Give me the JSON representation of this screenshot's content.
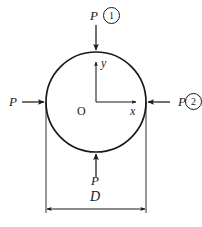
{
  "figure": {
    "shape": "circle",
    "stroke_color": "#1a1a1a",
    "background_color": "#ffffff",
    "geometry": {
      "center_x": 96,
      "center_y": 102,
      "radius": 50,
      "diameter": 100,
      "dimension_line_y": 209,
      "extension_left_x": 46,
      "extension_right_x": 146
    },
    "origin_label": "O",
    "axes": [
      {
        "name": "y-axis",
        "label": "y",
        "direction": "up"
      },
      {
        "name": "x-axis",
        "label": "x",
        "direction": "right"
      }
    ],
    "loads": [
      {
        "name": "load-top",
        "label": "P",
        "marker": "1",
        "direction": "down",
        "has_marker": true
      },
      {
        "name": "load-right",
        "label": "P",
        "marker": "2",
        "direction": "left",
        "has_marker": true
      },
      {
        "name": "load-left",
        "label": "P",
        "marker": "",
        "direction": "right",
        "has_marker": false
      },
      {
        "name": "load-bottom",
        "label": "P",
        "marker": "",
        "direction": "up",
        "has_marker": false
      }
    ],
    "dimension": {
      "label": "D",
      "name": "diameter-dimension"
    }
  }
}
